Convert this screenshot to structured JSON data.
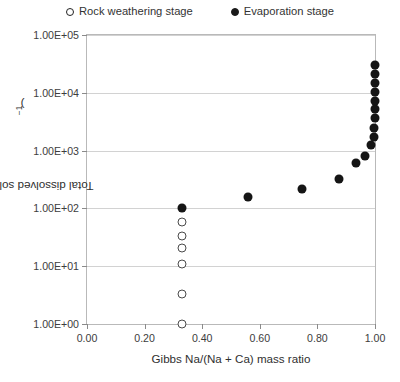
{
  "legend": {
    "position": "top-center",
    "entries": [
      {
        "label": "Rock weathering stage",
        "marker": "open-circle",
        "color": "#222222"
      },
      {
        "label": "Evaporation stage",
        "marker": "filled-circle",
        "color": "#1a1a1a"
      }
    ]
  },
  "axis": {
    "y_title_main": "Total dissolved solids (mg L",
    "y_title_sup": "−1",
    "y_title_close": ")",
    "x_title": "Gibbs Na/(Na + Ca) mass ratio",
    "y_ticks": [
      "1.00E+00",
      "1.00E+01",
      "1.00E+02",
      "1.00E+03",
      "1.00E+04",
      "1.00E+05"
    ],
    "x_ticks": [
      "0.00",
      "0.20",
      "0.40",
      "0.60",
      "0.80",
      "1.00"
    ]
  },
  "chart_data": {
    "type": "scatter",
    "title": "",
    "xlabel": "Gibbs Na/(Na + Ca) mass ratio",
    "ylabel": "Total dissolved solids (mg L−1)",
    "xlim": [
      0.0,
      1.0
    ],
    "ylim": [
      1,
      100000
    ],
    "yscale": "log",
    "xscale": "linear",
    "grid": "horizontal",
    "legend_position": "top-center",
    "series": [
      {
        "name": "Rock weathering stage",
        "marker": "open-circle",
        "color": "#4a4a4a",
        "points": [
          {
            "x": 0.33,
            "y": 58
          },
          {
            "x": 0.33,
            "y": 33
          },
          {
            "x": 0.33,
            "y": 21
          },
          {
            "x": 0.33,
            "y": 11
          },
          {
            "x": 0.33,
            "y": 3.3
          },
          {
            "x": 0.33,
            "y": 1.0
          }
        ]
      },
      {
        "name": "Evaporation stage",
        "marker": "filled-circle",
        "color": "#151515",
        "points": [
          {
            "x": 0.33,
            "y": 100
          },
          {
            "x": 0.56,
            "y": 155
          },
          {
            "x": 0.745,
            "y": 220
          },
          {
            "x": 0.875,
            "y": 320
          },
          {
            "x": 0.935,
            "y": 600
          },
          {
            "x": 0.965,
            "y": 820
          },
          {
            "x": 0.985,
            "y": 1250
          },
          {
            "x": 0.995,
            "y": 1750
          },
          {
            "x": 0.998,
            "y": 2500
          },
          {
            "x": 0.999,
            "y": 3600
          },
          {
            "x": 0.999,
            "y": 5200
          },
          {
            "x": 0.999,
            "y": 7200
          },
          {
            "x": 1.0,
            "y": 10500
          },
          {
            "x": 1.0,
            "y": 15000
          },
          {
            "x": 1.0,
            "y": 21000
          },
          {
            "x": 1.0,
            "y": 30000
          }
        ]
      }
    ]
  }
}
